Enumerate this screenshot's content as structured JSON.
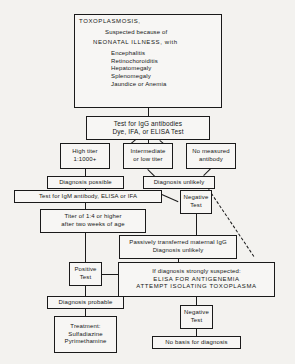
{
  "diagram": {
    "nodes": {
      "header": {
        "line1": "TOXOPLASMOSIS,",
        "line2": "Suspected because of",
        "line3": "NEONATAL ILLNESS, with",
        "symptom1": "Encephalitis",
        "symptom2": "Retinochoroiditis",
        "symptom3": "Hepatomegaly",
        "symptom4": "Splenomegaly",
        "symptom5": "Jaundice or Anemia"
      },
      "igg_test": {
        "line1": "Test for IgG antibodies",
        "line2": "Dye, IFA, or ELISA Test"
      },
      "high_titer": {
        "line1": "High titer",
        "line2": "1:1000+"
      },
      "intermediate_titer": {
        "line1": "Intermediate",
        "line2": "or low titer"
      },
      "no_antibody": {
        "line1": "No measured",
        "line2": "antibody"
      },
      "diagnosis_possible": {
        "line1": "Diagnosis possible"
      },
      "diagnosis_unlikely_right": {
        "line1": "Diagnosis unlikely"
      },
      "igm_test": {
        "line1": "Test for IgM antibody, ELISA or IFA"
      },
      "negative_test_upper": {
        "line1": "Negative",
        "line2": "Test"
      },
      "titer_age": {
        "line1": "Titer of 1:4 or higher",
        "line2": "after two weeks of age"
      },
      "maternal_igg": {
        "line1": "Passively transferred maternal IgG",
        "line2": "Diagnosis unlikely"
      },
      "positive_test": {
        "line1": "Positive",
        "line2": "Test"
      },
      "strongly_suspected": {
        "line1": "If diagnosis strongly suspected:",
        "line2": "ELISA FOR ANTIGENEMIA",
        "line3": "ATTEMPT ISOLATING TOXOPLASMA"
      },
      "negative_test_lower": {
        "line1": "Negative",
        "line2": "Test"
      },
      "diagnosis_probable": {
        "line1": "Diagnosis probable"
      },
      "treatment": {
        "line1": "Treatment:",
        "line2": "Sulfadiazine",
        "line3": "Pyrimethamine"
      },
      "no_basis": {
        "line1": "No basis for diagnosis"
      }
    },
    "colors": {
      "line": "#1a1a1a",
      "box_fill": "#f7f6f4",
      "background": "#f3f2ef",
      "text": "#161616"
    }
  }
}
